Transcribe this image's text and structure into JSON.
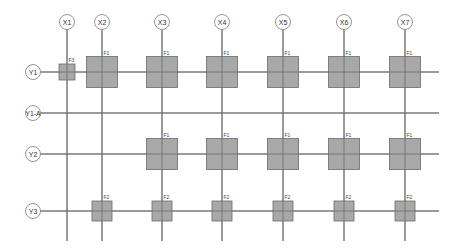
{
  "diagram": {
    "type": "structural-grid-plan",
    "columns": [
      {
        "id": "X1",
        "x": 67
      },
      {
        "id": "X2",
        "x": 102
      },
      {
        "id": "X3",
        "x": 162
      },
      {
        "id": "X4",
        "x": 222
      },
      {
        "id": "X5",
        "x": 283
      },
      {
        "id": "X6",
        "x": 344
      },
      {
        "id": "X7",
        "x": 405
      }
    ],
    "rows": [
      {
        "id": "Y1",
        "y": 72
      },
      {
        "id": "Y1-A",
        "y": 113
      },
      {
        "id": "Y2",
        "y": 154
      },
      {
        "id": "Y3",
        "y": 211
      }
    ],
    "footings": [
      {
        "label": "F3",
        "col": "X1",
        "row": "Y1",
        "size": 16
      },
      {
        "label": "F1",
        "col": "X2",
        "row": "Y1",
        "size": 31
      },
      {
        "label": "F1",
        "col": "X3",
        "row": "Y1",
        "size": 31
      },
      {
        "label": "F1",
        "col": "X4",
        "row": "Y1",
        "size": 31
      },
      {
        "label": "F1",
        "col": "X5",
        "row": "Y1",
        "size": 31
      },
      {
        "label": "F1",
        "col": "X6",
        "row": "Y1",
        "size": 31
      },
      {
        "label": "F1",
        "col": "X7",
        "row": "Y1",
        "size": 31
      },
      {
        "label": "F1",
        "col": "X3",
        "row": "Y2",
        "size": 31
      },
      {
        "label": "F1",
        "col": "X4",
        "row": "Y2",
        "size": 31
      },
      {
        "label": "F1",
        "col": "X5",
        "row": "Y2",
        "size": 31
      },
      {
        "label": "F1",
        "col": "X6",
        "row": "Y2",
        "size": 31
      },
      {
        "label": "F1",
        "col": "X7",
        "row": "Y2",
        "size": 31
      },
      {
        "label": "F2",
        "col": "X2",
        "row": "Y3",
        "size": 20
      },
      {
        "label": "F2",
        "col": "X3",
        "row": "Y3",
        "size": 20
      },
      {
        "label": "F2",
        "col": "X4",
        "row": "Y3",
        "size": 20
      },
      {
        "label": "F2",
        "col": "X5",
        "row": "Y3",
        "size": 20
      },
      {
        "label": "F2",
        "col": "X6",
        "row": "Y3",
        "size": 20
      },
      {
        "label": "F2",
        "col": "X7",
        "row": "Y3",
        "size": 20
      }
    ],
    "layout": {
      "col_bubble_y": 22,
      "row_bubble_x": 33,
      "bubble_radius": 7.5,
      "vline_top": 29,
      "vline_bottom": 241,
      "hline_left": 40,
      "hline_right": 439
    },
    "colors": {
      "line": "#6f6f6f",
      "footing_fill": "#a8a8a8",
      "footing_stroke": "#6a6a6a",
      "bubble_stroke": "#8a8a8a"
    }
  }
}
